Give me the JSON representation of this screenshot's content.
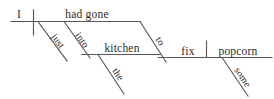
{
  "diagram": {
    "type": "reed-kellogg-sentence-diagram",
    "sentence": "I had just gone into the kitchen to fix some popcorn.",
    "stroke_color": "#58585a",
    "text_color": "#2b2b2b",
    "background_color": "#ffffff",
    "labels": {
      "subject": "I",
      "verb": "had gone",
      "adverb": "just",
      "preposition_1": "into",
      "object_of_preposition_1": "kitchen",
      "article": "the",
      "infinitive_marker": "to",
      "infinitive_verb": "fix",
      "direct_object": "popcorn",
      "determiner": "some"
    },
    "nodes": [
      {
        "id": "subject",
        "label": "I",
        "role": "subject",
        "baseline": "main",
        "orientation": "horizontal"
      },
      {
        "id": "verb",
        "label": "had gone",
        "role": "verb-phrase",
        "baseline": "main",
        "orientation": "horizontal"
      },
      {
        "id": "just",
        "label": "just",
        "role": "adverb-modifier",
        "attaches_to": "verb",
        "orientation": "diagonal"
      },
      {
        "id": "into",
        "label": "into",
        "role": "preposition",
        "attaches_to": "verb",
        "orientation": "diagonal"
      },
      {
        "id": "kitchen",
        "label": "kitchen",
        "role": "object-of-preposition",
        "attaches_to": "into",
        "orientation": "horizontal"
      },
      {
        "id": "the",
        "label": "the",
        "role": "article-modifier",
        "attaches_to": "kitchen",
        "orientation": "diagonal"
      },
      {
        "id": "to",
        "label": "to",
        "role": "infinitive-marker",
        "attaches_to": "verb",
        "orientation": "diagonal"
      },
      {
        "id": "fix",
        "label": "fix",
        "role": "infinitive-verb",
        "baseline": "infinitive",
        "orientation": "horizontal"
      },
      {
        "id": "popcorn",
        "label": "popcorn",
        "role": "direct-object",
        "baseline": "infinitive",
        "orientation": "horizontal"
      },
      {
        "id": "some",
        "label": "some",
        "role": "determiner-modifier",
        "attaches_to": "popcorn",
        "orientation": "diagonal"
      }
    ],
    "dividers": [
      {
        "id": "subject-verb-divider",
        "kind": "full-crossing-vertical",
        "between": [
          "I",
          "had gone"
        ]
      },
      {
        "id": "verb-object-divider",
        "kind": "short-standing-vertical",
        "between": [
          "fix",
          "popcorn"
        ]
      }
    ]
  }
}
